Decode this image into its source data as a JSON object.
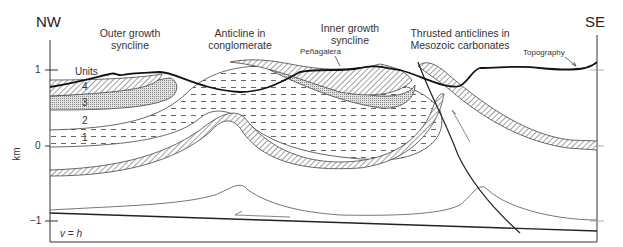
{
  "figure": {
    "directions": {
      "left": "NW",
      "right": "SE"
    },
    "headers": [
      {
        "id": "outer-syncline",
        "line1": "Outer growth",
        "line2": "syncline"
      },
      {
        "id": "anticline-conglomerate",
        "line1": "Anticline in",
        "line2": "conglomerate"
      },
      {
        "id": "inner-syncline",
        "line1": "Inner growth",
        "line2": "syncline"
      },
      {
        "id": "thrusted-anticlines",
        "line1": "Thrusted anticlines in",
        "line2": "Mesozoic carbonates"
      }
    ],
    "annotations": {
      "penagalera": "Peñagalera",
      "topography": "Topography",
      "units_title": "Units",
      "scale_note": "v = h"
    },
    "units": [
      "1",
      "2",
      "3",
      "4"
    ],
    "axis": {
      "label": "km",
      "ticks": [
        "1",
        "0",
        "−1"
      ]
    },
    "colors": {
      "line": "#222222",
      "thin_line": "#555555",
      "fill_light": "#f4f4f4",
      "fill_grid": "#bdbdbd"
    }
  }
}
